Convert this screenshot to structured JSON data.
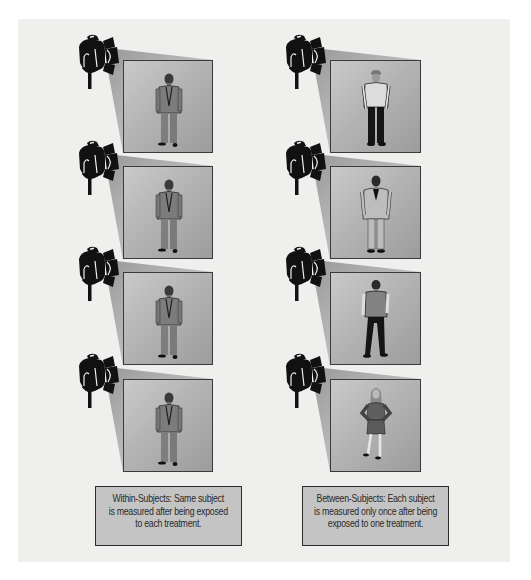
{
  "diagram": {
    "colors": {
      "background": "#efefee",
      "panel_light": "#c9c9c9",
      "panel_dark": "#9c9c9c",
      "beam": "#b8b8b8",
      "lamp": "#111111",
      "caption_fill": "#c4c4c4",
      "border": "#3a3a3a"
    },
    "columns": [
      {
        "id": "within",
        "panels": [
          {
            "subject": "man-in-suit",
            "icon": "spotlight-icon"
          },
          {
            "subject": "man-in-suit",
            "icon": "spotlight-icon"
          },
          {
            "subject": "man-in-suit",
            "icon": "spotlight-icon"
          },
          {
            "subject": "man-in-suit",
            "icon": "spotlight-icon"
          }
        ],
        "caption": {
          "lines": [
            "Within-Subjects: Same subject",
            "is measured after being exposed",
            "to each treatment."
          ]
        }
      },
      {
        "id": "between",
        "panels": [
          {
            "subject": "man-in-cap-and-jacket",
            "icon": "spotlight-icon"
          },
          {
            "subject": "man-in-blazer",
            "icon": "spotlight-icon"
          },
          {
            "subject": "man-in-vest",
            "icon": "spotlight-icon"
          },
          {
            "subject": "woman-in-skirt-suit",
            "icon": "spotlight-icon"
          }
        ],
        "caption": {
          "lines": [
            "Between-Subjects: Each subject",
            "is measured only once after being",
            "exposed to one treatment."
          ]
        }
      }
    ]
  }
}
